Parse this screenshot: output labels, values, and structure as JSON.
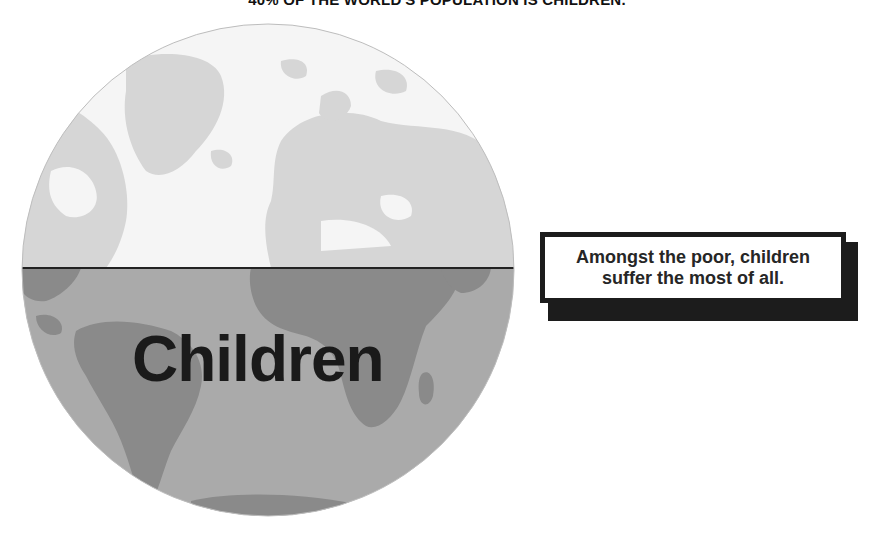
{
  "title": "40% OF THE WORLD'S POPULATION IS CHILDREN.",
  "globe": {
    "label": "Children",
    "icon": "globe-icon",
    "colors": {
      "upper_ocean": "#f5f5f5",
      "upper_land": "#d6d6d6",
      "lower_ocean": "#aaaaaa",
      "lower_land": "#8a8a8a",
      "equator_line": "#222222",
      "label": "#1a1a1a"
    }
  },
  "callout": {
    "line1": "Amongst the poor, children",
    "line2": "suffer the most of all.",
    "colors": {
      "border": "#1c1c1c",
      "shadow": "#1c1c1c",
      "background": "#ffffff"
    }
  }
}
